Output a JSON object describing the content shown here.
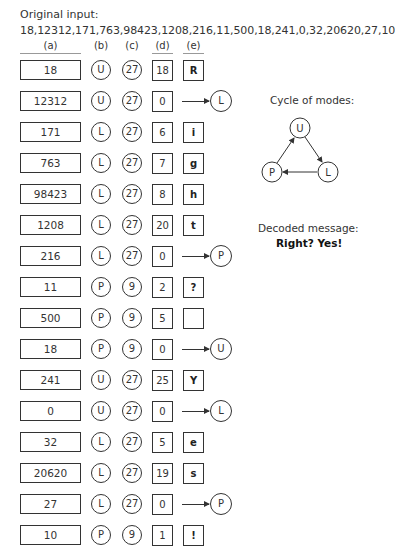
{
  "header": {
    "title": "Original input:",
    "input": "18,12312,171,763,98423,1208,216,11,500,18,241,0,32,20620,27,10",
    "columns": [
      "(a)",
      "(b)",
      "(c)",
      "(d)",
      "(e)"
    ]
  },
  "rows": [
    {
      "a": "18",
      "b": "U",
      "c": "27",
      "d": "18",
      "e": "R",
      "switch": null
    },
    {
      "a": "12312",
      "b": "U",
      "c": "27",
      "d": "0",
      "e": null,
      "switch": "L"
    },
    {
      "a": "171",
      "b": "L",
      "c": "27",
      "d": "6",
      "e": "i",
      "switch": null
    },
    {
      "a": "763",
      "b": "L",
      "c": "27",
      "d": "7",
      "e": "g",
      "switch": null
    },
    {
      "a": "98423",
      "b": "L",
      "c": "27",
      "d": "8",
      "e": "h",
      "switch": null
    },
    {
      "a": "1208",
      "b": "L",
      "c": "27",
      "d": "20",
      "e": "t",
      "switch": null
    },
    {
      "a": "216",
      "b": "L",
      "c": "27",
      "d": "0",
      "e": null,
      "switch": "P"
    },
    {
      "a": "11",
      "b": "P",
      "c": "9",
      "d": "2",
      "e": "?",
      "switch": null
    },
    {
      "a": "500",
      "b": "P",
      "c": "9",
      "d": "5",
      "e": " ",
      "switch": null
    },
    {
      "a": "18",
      "b": "P",
      "c": "9",
      "d": "0",
      "e": null,
      "switch": "U"
    },
    {
      "a": "241",
      "b": "U",
      "c": "27",
      "d": "25",
      "e": "Y",
      "switch": null
    },
    {
      "a": "0",
      "b": "U",
      "c": "27",
      "d": "0",
      "e": null,
      "switch": "L"
    },
    {
      "a": "32",
      "b": "L",
      "c": "27",
      "d": "5",
      "e": "e",
      "switch": null
    },
    {
      "a": "20620",
      "b": "L",
      "c": "27",
      "d": "19",
      "e": "s",
      "switch": null
    },
    {
      "a": "27",
      "b": "L",
      "c": "27",
      "d": "0",
      "e": null,
      "switch": "P"
    },
    {
      "a": "10",
      "b": "P",
      "c": "9",
      "d": "1",
      "e": "!",
      "switch": null
    }
  ],
  "cycle": {
    "title": "Cycle of modes:",
    "nodes": [
      "U",
      "L",
      "P"
    ],
    "edges": [
      [
        "U",
        "L"
      ],
      [
        "L",
        "P"
      ],
      [
        "P",
        "U"
      ]
    ]
  },
  "decoded": {
    "label": "Decoded message:",
    "message": "Right? Yes!"
  }
}
